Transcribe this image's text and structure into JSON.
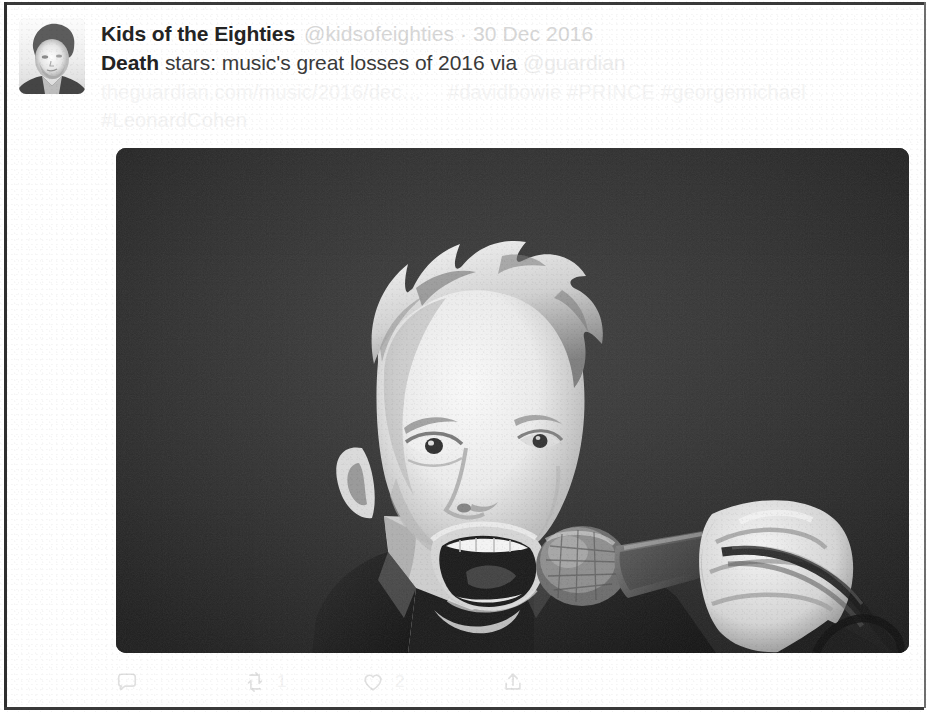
{
  "card": {
    "type": "social-post",
    "platform": "twitter-tweet-card"
  },
  "author": {
    "display_name": "Kids of the Eighties",
    "handle_and_date": "@kidsofeighties · 30 Dec 2016",
    "avatar_alt": "avatar-photo"
  },
  "tweet": {
    "lead_bold_word": "Death",
    "body_text": " stars: music's great losses of 2016 via ",
    "via_handle": "@guardian",
    "link_text": "theguardian.com/music/2016/dec…",
    "hashtags_line1": "#davidbowie #PRINCE #georgemichael",
    "hashtags_line2": "#LeonardCohen"
  },
  "photo": {
    "alt": "black-and-white photo of a singer shouting into a microphone",
    "is_monochrome": true
  },
  "actions": [
    {
      "name": "reply",
      "icon": "reply-icon",
      "count": ""
    },
    {
      "name": "retweet",
      "icon": "retweet-icon",
      "count": "1"
    },
    {
      "name": "like",
      "icon": "heart-icon",
      "count": "2"
    },
    {
      "name": "share",
      "icon": "share-icon",
      "count": ""
    }
  ],
  "colors": {
    "name_text": "#242424",
    "body_text": "#3a3a3a",
    "muted_text": "#d7d7d7",
    "very_faded_text": "#f2f2f2",
    "card_background": "#ffffff",
    "frame_border": "#2e2e2e"
  }
}
